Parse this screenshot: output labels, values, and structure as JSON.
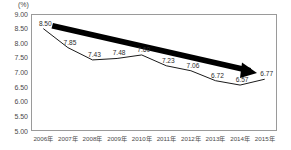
{
  "chart_data": {
    "type": "line",
    "title": "",
    "subtitle": "",
    "unit_label": "(%)",
    "xlabel": "",
    "ylabel": "",
    "categories": [
      "2006年",
      "2007年",
      "2008年",
      "2009年",
      "2010年",
      "2011年",
      "2012年",
      "2013年",
      "2014年",
      "2015年"
    ],
    "values": [
      8.5,
      7.85,
      7.43,
      7.48,
      7.6,
      7.23,
      7.06,
      6.72,
      6.57,
      6.77
    ],
    "point_labels": [
      "8.50",
      "7.85",
      "7.43",
      "7.48",
      "7.60",
      "7.23",
      "7.06",
      "6.72",
      "6.57",
      "6.77"
    ],
    "ylim": [
      5.0,
      9.0
    ],
    "ytick_labels": [
      "9.00",
      "8.50",
      "8.00",
      "7.50",
      "7.00",
      "6.50",
      "6.00",
      "5.50",
      "5.00"
    ],
    "ytick_values": [
      9.0,
      8.5,
      8.0,
      7.5,
      7.0,
      6.5,
      6.0,
      5.5,
      5.0
    ],
    "grid": false,
    "legend": false,
    "legend_position": "none",
    "series_color": "#1a1a1a",
    "annotation": {
      "name": "downward-trend-arrow",
      "shape": "thick-arrow",
      "color": "#000000",
      "from_year": "2006年",
      "to_year": "2015年",
      "direction": "down-right"
    }
  },
  "axes": {
    "frame_color": "#9a9a9a",
    "tick_text_color": "#4a4a4a"
  }
}
